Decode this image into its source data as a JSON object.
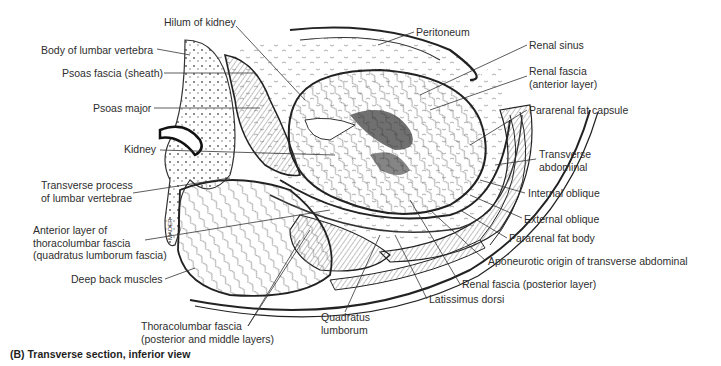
{
  "figure": {
    "caption": "(B) Transverse section, inferior view",
    "signature": "MADER",
    "labels": [
      {
        "id": "hilum-of-kidney",
        "text": "Hilum of kidney",
        "x": 164,
        "y": 20,
        "align": "left"
      },
      {
        "id": "body-of-lumbar-vertebra",
        "text": "Body of lumbar vertebra",
        "x": 41,
        "y": 44,
        "align": "left"
      },
      {
        "id": "psoas-fascia-sheath",
        "text": "Psoas fascia (sheath)",
        "x": 62,
        "y": 67,
        "align": "left"
      },
      {
        "id": "psoas-major",
        "text": "Psoas major",
        "x": 93,
        "y": 102,
        "align": "left"
      },
      {
        "id": "kidney",
        "text": "Kidney",
        "x": 124,
        "y": 143,
        "align": "left"
      },
      {
        "id": "transverse-process",
        "text": "Transverse process\nof lumbar vertebrae",
        "x": 41,
        "y": 179,
        "align": "left"
      },
      {
        "id": "anterior-layer-thoracolumbar-fascia",
        "text": "Anterior layer of\nthoracolumbar fascia\n(quadratus lumborum fascia)",
        "x": 33,
        "y": 224,
        "align": "left"
      },
      {
        "id": "deep-back-muscles",
        "text": "Deep back muscles",
        "x": 71,
        "y": 273,
        "align": "left"
      },
      {
        "id": "thoracolumbar-fascia",
        "text": "Thoracolumbar fascia\n(posterior and middle layers)",
        "x": 141,
        "y": 320,
        "align": "left"
      },
      {
        "id": "quadratus-lumborum",
        "text": "Quadratus\nlumborum",
        "x": 321,
        "y": 311,
        "align": "left"
      },
      {
        "id": "peritoneum",
        "text": "Peritoneum",
        "x": 416,
        "y": 26,
        "align": "left"
      },
      {
        "id": "renal-sinus",
        "text": "Renal sinus",
        "x": 529,
        "y": 39,
        "align": "left"
      },
      {
        "id": "renal-fascia-anterior",
        "text": "Renal fascia\n(anterior layer)",
        "x": 529,
        "y": 65,
        "align": "left"
      },
      {
        "id": "pararenal-fat-capsule",
        "text": "Pararenal fat capsule",
        "x": 529,
        "y": 104,
        "align": "left"
      },
      {
        "id": "transverse-abdominal",
        "text": "Transverse\nabdominal",
        "x": 539,
        "y": 148,
        "align": "left"
      },
      {
        "id": "internal-oblique",
        "text": "Internal oblique",
        "x": 528,
        "y": 187,
        "align": "left"
      },
      {
        "id": "external-oblique",
        "text": "External oblique",
        "x": 524,
        "y": 213,
        "align": "left"
      },
      {
        "id": "pararenal-fat-body",
        "text": "Pararenal fat body",
        "x": 509,
        "y": 232,
        "align": "left"
      },
      {
        "id": "aponeurotic-origin",
        "text": "Aponeurotic origin of transverse abdominal",
        "x": 488,
        "y": 255,
        "align": "left"
      },
      {
        "id": "renal-fascia-posterior",
        "text": "Renal fascia (posterior layer)",
        "x": 462,
        "y": 278,
        "align": "left"
      },
      {
        "id": "latissimus-dorsi",
        "text": "Latissimus dorsi",
        "x": 429,
        "y": 293,
        "align": "left"
      }
    ]
  }
}
